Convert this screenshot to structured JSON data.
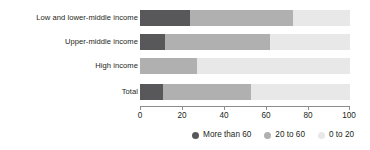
{
  "chart_data": {
    "type": "bar",
    "orientation": "horizontal",
    "stacked": true,
    "stack_mode": "percent",
    "title": "",
    "subtitle": "",
    "xlabel": "",
    "ylabel": "",
    "xlim": [
      0,
      100
    ],
    "xticks": [
      0,
      20,
      40,
      60,
      80,
      100
    ],
    "xtick_labels": [
      "0",
      "20",
      "40",
      "60",
      "80",
      "100"
    ],
    "grid": false,
    "legend_position": "bottom-right",
    "categories": [
      "Low and lower-middle income",
      "Upper-middle income",
      "High income",
      "Total"
    ],
    "series": [
      {
        "name": "More than 60",
        "color": "#58585a",
        "values": [
          24,
          12,
          0,
          11
        ]
      },
      {
        "name": "20 to 60",
        "color": "#b0b0b0",
        "values": [
          49,
          50,
          27,
          42
        ]
      },
      {
        "name": "0 to 20",
        "color": "#e8e8e8",
        "values": [
          27,
          38,
          73,
          47
        ]
      }
    ],
    "legend": [
      {
        "label": "More than 60",
        "color": "#58585a"
      },
      {
        "label": "20 to 60",
        "color": "#b0b0b0"
      },
      {
        "label": "0 to 20",
        "color": "#e8e8e8"
      }
    ],
    "axis_color": "#8d8d8d",
    "text_color": "#231f20",
    "background": "#ffffff"
  }
}
